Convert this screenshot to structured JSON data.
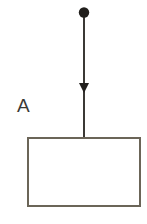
{
  "figure": {
    "title": "",
    "background_color": "#ffffff",
    "canvas": {
      "width": 147,
      "height": 224
    },
    "labels": [
      {
        "id": "a",
        "text": "A",
        "x": 19,
        "y": 99,
        "color": "#3a3a36"
      }
    ],
    "elements": {
      "pivot_dot": {
        "name": "pivot point",
        "shape": "filled-circle",
        "cx": 84,
        "cy": 12.5,
        "r": 5.2,
        "color": "#211f1c"
      },
      "vertical_line": {
        "name": "vertical connector line",
        "shape": "line",
        "x1": 84,
        "y1": 12,
        "x2": 84,
        "y2": 138,
        "color": "#3b3935",
        "stroke_width": 2
      },
      "arrow_head": {
        "name": "downward arrowhead",
        "shape": "triangle",
        "direction": "down",
        "tip_x": 84,
        "tip_y": 93,
        "left_x": 79,
        "right_x": 89,
        "base_y": 83,
        "color": "#211f1c"
      },
      "block_rectangle": {
        "name": "block",
        "shape": "rectangle",
        "x": 27,
        "y": 137,
        "width": 114,
        "height": 70,
        "stroke_color": "#6b6558",
        "stroke_width": 2,
        "fill": "#ffffff"
      }
    },
    "colors": {
      "stroke_dark": "#211f1c",
      "stroke_line": "#3b3935",
      "stroke_rect": "#6b6558",
      "background": "#ffffff",
      "label": "#3a3a36"
    }
  }
}
